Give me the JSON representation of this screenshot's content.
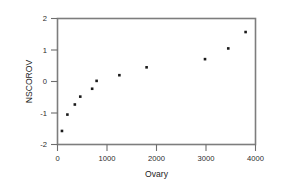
{
  "chart_data": {
    "type": "scatter",
    "title": "",
    "subtitle": "",
    "xlabel": "Ovary",
    "ylabel": "NSCOROV",
    "xlim": [
      0,
      4000
    ],
    "ylim": [
      -2,
      2
    ],
    "xticks": [
      0,
      1000,
      2000,
      3000,
      4000
    ],
    "yticks": [
      -2,
      -1,
      0,
      1,
      2
    ],
    "xtick_labels": [
      "0",
      "1000",
      "2000",
      "3000",
      "4000"
    ],
    "ytick_labels": [
      "-2",
      "-1",
      "0",
      "1",
      "2"
    ],
    "grid": false,
    "legend": null,
    "legend_position": "none",
    "marker": "square",
    "marker_color": "#1a1a1a",
    "frame_color": "#7d7d7d",
    "annotations": [],
    "points": [
      {
        "x": 90,
        "y": -1.57
      },
      {
        "x": 200,
        "y": -1.05
      },
      {
        "x": 350,
        "y": -0.73
      },
      {
        "x": 460,
        "y": -0.48
      },
      {
        "x": 700,
        "y": -0.23
      },
      {
        "x": 790,
        "y": 0.02
      },
      {
        "x": 1250,
        "y": 0.2
      },
      {
        "x": 1800,
        "y": 0.45
      },
      {
        "x": 2980,
        "y": 0.71
      },
      {
        "x": 3450,
        "y": 1.05
      },
      {
        "x": 3800,
        "y": 1.57
      }
    ],
    "series": [
      {
        "name": "NSCOROV vs Ovary",
        "x": [
          90,
          200,
          350,
          460,
          700,
          790,
          1250,
          1800,
          2980,
          3450,
          3800
        ],
        "values": [
          -1.57,
          -1.05,
          -0.73,
          -0.48,
          -0.23,
          0.02,
          0.2,
          0.45,
          0.71,
          1.05,
          1.57
        ]
      }
    ]
  },
  "axes": {
    "x_title": "Ovary",
    "y_title": "NSCOROV"
  }
}
